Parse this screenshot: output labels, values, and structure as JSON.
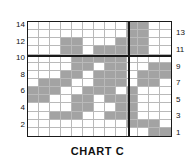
{
  "chart_data": {
    "type": "heatmap",
    "title": "CHART C",
    "xlabel": "",
    "ylabel": "",
    "grid": true,
    "legend": "none",
    "columns": 13,
    "rows": 14,
    "left_axis_ticks": [
      "14",
      "12",
      "10",
      "8",
      "6",
      "4",
      "2"
    ],
    "right_axis_ticks": [
      "13",
      "11",
      "9",
      "7",
      "5",
      "3",
      "1"
    ],
    "ylim": [
      1,
      14
    ],
    "xlim": [
      1,
      13
    ],
    "cell_on_color": "#a3a3a3",
    "cell_off_color": "#ffffff",
    "gridline_color": "#b9b9b9",
    "border_color": "#1a1a1a",
    "emphasis_rules": {
      "horizontal_after_row_from_top": 4,
      "vertical_after_column": 9
    },
    "matrix_note": "Row 1 = top (value 14), Row 14 = bottom (value 1). 1 = shaded, 0 = empty.",
    "matrix": [
      [
        0,
        0,
        0,
        0,
        0,
        0,
        0,
        0,
        0,
        1,
        1,
        0,
        0
      ],
      [
        0,
        0,
        0,
        0,
        0,
        0,
        0,
        0,
        0,
        1,
        1,
        0,
        0
      ],
      [
        0,
        0,
        0,
        1,
        1,
        0,
        0,
        0,
        1,
        1,
        1,
        0,
        0
      ],
      [
        0,
        0,
        0,
        1,
        1,
        0,
        1,
        1,
        1,
        1,
        1,
        0,
        0
      ],
      [
        0,
        0,
        0,
        0,
        1,
        1,
        1,
        1,
        1,
        0,
        0,
        0,
        0
      ],
      [
        0,
        0,
        0,
        0,
        1,
        1,
        0,
        1,
        1,
        0,
        0,
        1,
        1
      ],
      [
        0,
        0,
        0,
        1,
        1,
        0,
        1,
        1,
        1,
        0,
        1,
        1,
        1
      ],
      [
        0,
        1,
        1,
        1,
        0,
        0,
        1,
        1,
        1,
        0,
        1,
        1,
        0
      ],
      [
        1,
        1,
        1,
        0,
        0,
        1,
        1,
        1,
        0,
        1,
        0,
        0,
        0
      ],
      [
        1,
        1,
        0,
        0,
        1,
        1,
        0,
        1,
        1,
        1,
        0,
        0,
        0
      ],
      [
        0,
        0,
        0,
        0,
        1,
        1,
        0,
        0,
        1,
        1,
        0,
        0,
        0
      ],
      [
        0,
        0,
        1,
        1,
        1,
        0,
        0,
        1,
        1,
        1,
        0,
        0,
        0
      ],
      [
        0,
        0,
        0,
        0,
        0,
        0,
        0,
        0,
        0,
        1,
        1,
        1,
        0
      ],
      [
        0,
        0,
        0,
        0,
        0,
        0,
        0,
        0,
        0,
        0,
        0,
        1,
        1
      ]
    ]
  }
}
